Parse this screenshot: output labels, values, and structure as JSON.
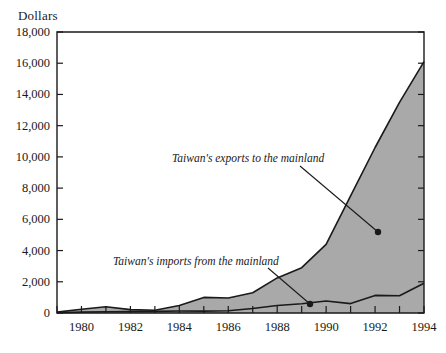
{
  "chart_data": {
    "type": "area",
    "title": "",
    "xlabel": "",
    "ylabel": "Dollars",
    "ylim": [
      0,
      18000
    ],
    "xlim": [
      1979,
      1994
    ],
    "grid": false,
    "legend_position": "inline-annotations",
    "y_ticks": [
      "0",
      "2,000",
      "4,000",
      "6,000",
      "8,000",
      "10,000",
      "12,000",
      "14,000",
      "16,000",
      "18,000"
    ],
    "y_tick_values": [
      0,
      2000,
      4000,
      6000,
      8000,
      10000,
      12000,
      14000,
      16000,
      18000
    ],
    "x_ticks_all": [
      1979,
      1980,
      1981,
      1982,
      1983,
      1984,
      1985,
      1986,
      1987,
      1988,
      1989,
      1990,
      1991,
      1992,
      1993,
      1994
    ],
    "x_tick_labels": [
      "1980",
      "1982",
      "1984",
      "1986",
      "1988",
      "1990",
      "1992",
      "1994"
    ],
    "x_tick_label_values": [
      1980,
      1982,
      1984,
      1986,
      1988,
      1990,
      1992,
      1994
    ],
    "x": [
      1979,
      1980,
      1981,
      1982,
      1983,
      1984,
      1985,
      1986,
      1987,
      1988,
      1989,
      1990,
      1991,
      1992,
      1993,
      1994
    ],
    "series": [
      {
        "name": "Taiwan's exports to the mainland",
        "style": "filled-area",
        "fill_color": "#a9a9a9",
        "line_color": "#1a1a1a",
        "values": [
          60,
          240,
          400,
          220,
          180,
          480,
          1000,
          960,
          1300,
          2250,
          2900,
          4400,
          7500,
          10600,
          13500,
          16100
        ]
      },
      {
        "name": "Taiwan's imports from the mainland",
        "style": "line",
        "line_color": "#1a1a1a",
        "values": [
          20,
          60,
          80,
          90,
          100,
          130,
          120,
          150,
          290,
          480,
          590,
          770,
          600,
          1130,
          1100,
          1900
        ]
      }
    ],
    "annotations": [
      {
        "text": "Taiwan's exports to the mainland",
        "label_x": 172,
        "label_y": 152,
        "leader_from_x": 300,
        "leader_from_y": 166,
        "leader_to_x": 378,
        "leader_to_y": 232,
        "dot_x": 378,
        "dot_y": 232
      },
      {
        "text": "Taiwan's imports from the mainland",
        "label_x": 113,
        "label_y": 255,
        "leader_from_x": 268,
        "leader_from_y": 268,
        "leader_to_x": 310,
        "leader_to_y": 304,
        "dot_x": 310,
        "dot_y": 304
      }
    ]
  },
  "colors": {
    "area_fill": "#a9a9a9",
    "line": "#1a1a1a",
    "frame": "#1a1a1a",
    "background": "#ffffff"
  }
}
